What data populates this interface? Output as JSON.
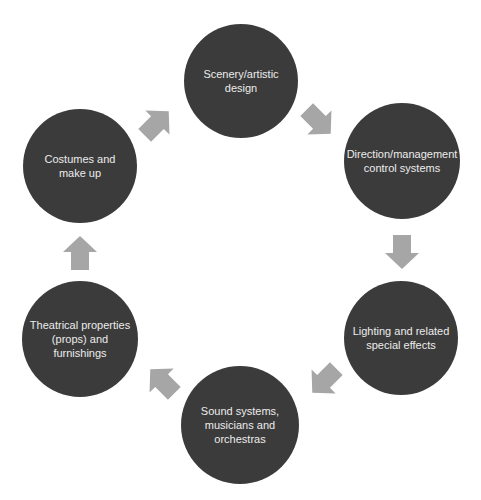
{
  "diagram": {
    "type": "cycle",
    "colors": {
      "node_fill": "#3b3b3b",
      "node_text": "#ececec",
      "arrow_fill": "#a6a6a6",
      "background": "#ffffff"
    },
    "nodes": [
      {
        "id": "scenery",
        "label": "Scenery/artistic\ndesign",
        "cx": 241,
        "cy": 81,
        "r": 57
      },
      {
        "id": "direction",
        "label": "Direction/management\ncontrol systems",
        "cx": 402,
        "cy": 161,
        "r": 58
      },
      {
        "id": "lighting",
        "label": "Lighting and related\nspecial effects",
        "cx": 401,
        "cy": 338,
        "r": 57
      },
      {
        "id": "sound",
        "label": "Sound systems,\nmusicians and\norchestras",
        "cx": 240,
        "cy": 425,
        "r": 59
      },
      {
        "id": "props",
        "label": "Theatrical properties\n(props) and\nfurnishings",
        "cx": 80,
        "cy": 339,
        "r": 58
      },
      {
        "id": "costumes",
        "label": "Costumes and\nmake up",
        "cx": 80,
        "cy": 166,
        "r": 57
      }
    ],
    "arrows": [
      {
        "from": "scenery",
        "to": "direction",
        "cx": 318,
        "cy": 121,
        "angle": 45
      },
      {
        "from": "direction",
        "to": "lighting",
        "cx": 402,
        "cy": 251,
        "angle": 90
      },
      {
        "from": "lighting",
        "to": "sound",
        "cx": 325,
        "cy": 380,
        "angle": 135
      },
      {
        "from": "sound",
        "to": "props",
        "cx": 163,
        "cy": 382,
        "angle": 225
      },
      {
        "from": "props",
        "to": "costumes",
        "cx": 80,
        "cy": 254,
        "angle": 270
      },
      {
        "from": "costumes",
        "to": "scenery",
        "cx": 156,
        "cy": 124,
        "angle": 315
      }
    ]
  }
}
